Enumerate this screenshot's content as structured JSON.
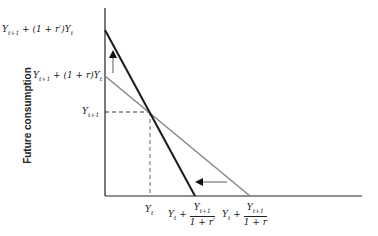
{
  "diagram": {
    "y_axis_label": "Future consumption",
    "y_ticks": [
      {
        "label": "Y",
        "sub": "t+1",
        "rest": " + (1 + r′)Y",
        "sub2": "t"
      },
      {
        "label": "Y",
        "sub": "t+1",
        "rest": " + (1 + r)Y",
        "sub2": "t"
      },
      {
        "label": "Y",
        "sub": "t+1",
        "rest": "",
        "sub2": ""
      }
    ],
    "x_ticks": [
      {
        "label": "Y",
        "sub": "t"
      },
      {
        "label": "Y",
        "sub": "t",
        "plus": " + ",
        "num": "Y",
        "numsub": "t+1",
        "den": "1 + r′"
      },
      {
        "label": "Y",
        "sub": "t",
        "plus": " + ",
        "num": "Y",
        "numsub": "t+1",
        "den": "1 + r"
      }
    ],
    "lines": [
      {
        "name": "budget-line-new-rate",
        "color": "#1a1a1a",
        "from": [
          105,
          30
        ],
        "to": [
          195,
          196
        ]
      },
      {
        "name": "budget-line-original-rate",
        "color": "#8a8a8a",
        "from": [
          105,
          76
        ],
        "to": [
          250,
          196
        ]
      }
    ],
    "endowment_point": [
      150,
      112
    ],
    "arrows": [
      "up-arrow: vertical intercept rises",
      "left-arrow: horizontal intercept falls"
    ]
  }
}
